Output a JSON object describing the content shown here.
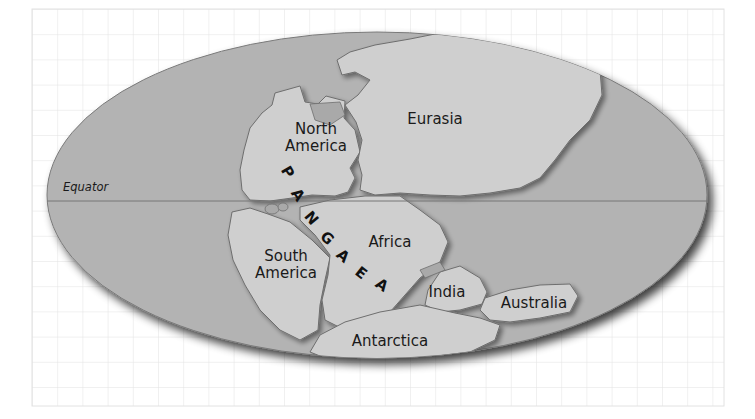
{
  "map": {
    "title": "Pangaea",
    "equator_label": "Equator",
    "supercontinent_letters": [
      "P",
      "A",
      "N",
      "G",
      "A",
      "E",
      "A"
    ],
    "continents": [
      {
        "id": "north-america",
        "line1": "North",
        "line2": "America"
      },
      {
        "id": "eurasia",
        "line1": "Eurasia"
      },
      {
        "id": "south-america",
        "line1": "South",
        "line2": "America"
      },
      {
        "id": "africa",
        "line1": "Africa"
      },
      {
        "id": "india",
        "line1": "India"
      },
      {
        "id": "australia",
        "line1": "Australia"
      },
      {
        "id": "antarctica",
        "line1": "Antarctica"
      }
    ],
    "colors": {
      "grid": "#e2e2e2",
      "ocean": "#b3b3b3",
      "land": "#cfcfcf",
      "coast": "#6e6e6e",
      "shadow": "#333333",
      "text": "#1a1a1a"
    }
  }
}
